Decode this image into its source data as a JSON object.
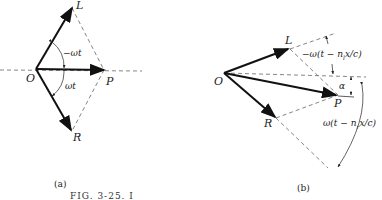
{
  "figure": {
    "caption": "FIG. 3-25. I",
    "panel_a": {
      "label": "(a)",
      "points": {
        "O": "O",
        "L": "L",
        "R": "R",
        "P": "P"
      },
      "angle_upper": "−ωt",
      "angle_lower": "ωt"
    },
    "panel_b": {
      "label": "(b)",
      "points": {
        "O": "O",
        "L": "L",
        "R": "R",
        "P": "P"
      },
      "angle_upper": "−ω(t − n",
      "angle_upper_sub": "l",
      "angle_upper_tail": "x/c)",
      "angle_alpha": "α",
      "angle_lower": "ω(t − n",
      "angle_lower_sub": "r",
      "angle_lower_tail": "x/c)"
    }
  }
}
